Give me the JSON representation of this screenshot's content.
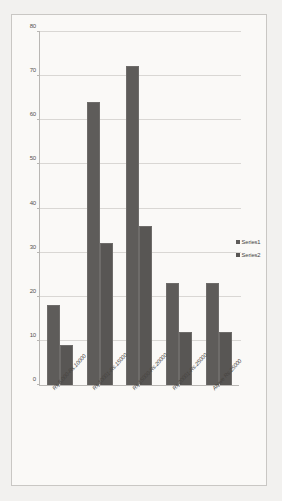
{
  "chart_data": {
    "type": "bar",
    "title": "",
    "subtitle": "",
    "xlabel": "",
    "ylabel": "",
    "ylim": [
      0,
      80
    ],
    "ytick_step": 10,
    "yticks": [
      0,
      10,
      20,
      30,
      40,
      50,
      60,
      70,
      80
    ],
    "grid": true,
    "legend_position": "right",
    "categories": [
      "Rs.5,000-Rs.10000",
      "Rs.10001-Rs.15000",
      "Rs.15000-Rs.20000",
      "Rs.20001-Rs.25000",
      "Above  Rs.25000"
    ],
    "series": [
      {
        "name": "Series1",
        "color": "#5e5c5a",
        "values": [
          18,
          64,
          72,
          23,
          23
        ]
      },
      {
        "name": "Series2",
        "color": "#585654",
        "values": [
          9,
          32,
          36,
          12,
          12
        ]
      }
    ]
  },
  "legend": {
    "entries": [
      {
        "label": "Series1"
      },
      {
        "label": "Series2"
      }
    ]
  },
  "colors": {
    "page_background": "#f2f1ef",
    "chart_background": "#faf9f7",
    "border": "#c9c7c4",
    "gridline": "#d9d7d4",
    "axis": "#b9b7b4",
    "text": "#46433f",
    "bar_series1": "#5e5c5a",
    "bar_series2": "#585654"
  }
}
